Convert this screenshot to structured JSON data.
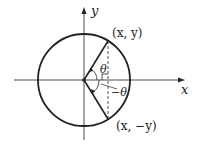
{
  "diagram": {
    "title": "",
    "axes": {
      "x_label": "x",
      "y_label": "y"
    },
    "points": {
      "upper": "(x, y)",
      "lower": "(x, −y)"
    },
    "angles": {
      "upper": "θ",
      "lower": "−θ"
    },
    "colors": {
      "stroke": "#222222",
      "background": "#ffffff"
    }
  }
}
